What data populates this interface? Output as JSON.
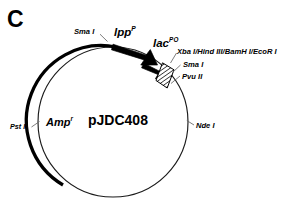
{
  "figure": {
    "panel_label": "C",
    "plasmid_name": "pJDC408",
    "type": "plasmid-map"
  },
  "circle": {
    "center_x": 113,
    "center_y": 122,
    "radius": 75,
    "thick_arc_color": "#000000",
    "thin_arc_color": "#1a1a1a"
  },
  "features": [
    {
      "name": "lpp-promoter-arrow",
      "label": "lpp",
      "superscript": "P",
      "shape": "arrow",
      "fill": "#000000"
    },
    {
      "name": "lac-arrow",
      "label": "lac",
      "superscript": "PO",
      "shape": "arrow",
      "fill": "#000000"
    },
    {
      "name": "polylinker-box",
      "label": "",
      "shape": "hatched-box",
      "fill": "#ffffff",
      "hatch": "#000000"
    },
    {
      "name": "amp-resistance-arc",
      "label": "Amp",
      "superscript": "r",
      "shape": "thick-arc",
      "fill": "#000000"
    }
  ],
  "restriction_sites": [
    {
      "id": "sma-i-left",
      "label": "Sma I"
    },
    {
      "id": "xba-hind-bamh-ecor",
      "label": "Xba I/Hind III/BamH I/EcoR I"
    },
    {
      "id": "sma-i-right",
      "label": "Sma I"
    },
    {
      "id": "pvu-ii",
      "label": "Pvu II"
    },
    {
      "id": "nde-i",
      "label": "Nde I"
    },
    {
      "id": "pst-i",
      "label": "Pst I"
    }
  ],
  "colors": {
    "ink": "#000000",
    "background": "#ffffff",
    "leader": "#555555"
  }
}
